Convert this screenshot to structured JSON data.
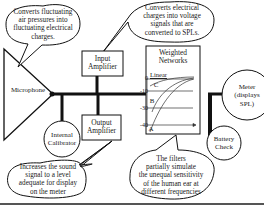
{
  "components": {
    "microphone": "Microphone",
    "input_amplifier": [
      "Input",
      "Amplifier"
    ],
    "output_amplifier": [
      "Output",
      "Amplifier"
    ],
    "internal_calibrator": [
      "Internal",
      "Calibrator"
    ],
    "weighted_networks": [
      "Weighted",
      "Networks"
    ],
    "meter": [
      "Meter",
      "(displays",
      "SPL)"
    ],
    "battery_check": [
      "Battery",
      "Check"
    ]
  },
  "callouts": {
    "microphone": [
      "Converts fluctuating",
      "air pressures into",
      "fluctuating electrical",
      "charges."
    ],
    "input_amplifier": [
      "Converts electrical",
      "charges into voltage",
      "signals that are",
      "converted to SPLs."
    ],
    "output_amplifier": [
      "Increases the sound",
      "signal to a level",
      "adequate for display",
      "on the meter"
    ],
    "weighted_networks": [
      "The filters",
      "partially simulate",
      "the unequal sensitivity",
      "of the human ear at",
      "different frequencies"
    ]
  },
  "weighting_graph": {
    "y_ticks": [
      "0",
      "-10",
      "-30",
      "-40"
    ],
    "curves": [
      "Linear",
      "C",
      "B",
      "A"
    ]
  },
  "colors": {
    "line": "#111111",
    "text": "#222222",
    "background": "#ffffff"
  }
}
